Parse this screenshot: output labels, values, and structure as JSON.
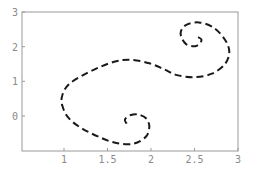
{
  "chart_data": {
    "type": "line",
    "title": "",
    "xlabel": "",
    "ylabel": "",
    "xlim": [
      0.5,
      3.0
    ],
    "ylim": [
      -1.0,
      3.0
    ],
    "x_ticks": [
      "1",
      "1.5",
      "2",
      "2.5",
      "3"
    ],
    "x_tick_values": [
      1,
      1.5,
      2,
      2.5,
      3
    ],
    "y_ticks": [
      "0",
      "1",
      "2",
      "3"
    ],
    "y_tick_values": [
      0,
      1,
      2,
      3
    ],
    "grid": false,
    "legend": null,
    "line_style": "dashed",
    "line_color": "#1a1a1a",
    "frame_color": "#9a9a9a",
    "series": [
      {
        "name": "curve",
        "points": [
          [
            1.72,
            -0.22
          ],
          [
            1.7,
            -0.1
          ],
          [
            1.76,
            0.02
          ],
          [
            1.86,
            0.04
          ],
          [
            1.95,
            -0.08
          ],
          [
            1.98,
            -0.32
          ],
          [
            1.94,
            -0.6
          ],
          [
            1.8,
            -0.8
          ],
          [
            1.6,
            -0.78
          ],
          [
            1.4,
            -0.6
          ],
          [
            1.2,
            -0.35
          ],
          [
            1.05,
            -0.05
          ],
          [
            0.98,
            0.3
          ],
          [
            0.98,
            0.6
          ],
          [
            1.05,
            0.9
          ],
          [
            1.2,
            1.15
          ],
          [
            1.4,
            1.4
          ],
          [
            1.6,
            1.58
          ],
          [
            1.78,
            1.62
          ],
          [
            1.98,
            1.52
          ],
          [
            2.15,
            1.35
          ],
          [
            2.3,
            1.18
          ],
          [
            2.5,
            1.12
          ],
          [
            2.7,
            1.22
          ],
          [
            2.85,
            1.5
          ],
          [
            2.9,
            1.85
          ],
          [
            2.85,
            2.2
          ],
          [
            2.72,
            2.55
          ],
          [
            2.55,
            2.7
          ],
          [
            2.4,
            2.62
          ],
          [
            2.34,
            2.38
          ],
          [
            2.4,
            2.08
          ],
          [
            2.52,
            2.02
          ],
          [
            2.58,
            2.2
          ],
          [
            2.5,
            2.32
          ]
        ]
      }
    ]
  }
}
